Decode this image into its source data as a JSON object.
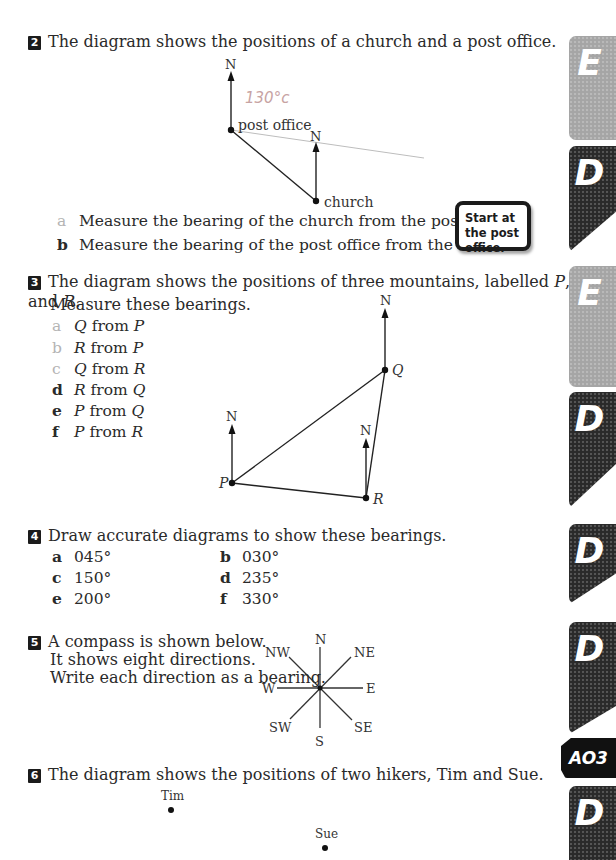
{
  "questions": {
    "q2": {
      "number": "2",
      "text": "The diagram shows the positions of a church and a post office.",
      "diagram": {
        "north_label": "N",
        "post_office_label": "post office",
        "church_label": "church",
        "handwritten_note": "130°c"
      },
      "parts": [
        {
          "label": "a",
          "text": "Measure the bearing of the church from the post office."
        },
        {
          "label": "b",
          "text": "Measure the bearing of the post office from the church."
        }
      ],
      "hint": "Start at the post office."
    },
    "q3": {
      "number": "3",
      "text": "The diagram shows the positions of three mountains, labelled P, Q and R.",
      "text_parts": [
        "The diagram shows the positions of three mountains, labelled ",
        "P",
        ", ",
        "Q",
        " and ",
        "R",
        "."
      ],
      "instruction": "Measure these bearings.",
      "diagram": {
        "north_label": "N",
        "points": [
          "P",
          "Q",
          "R"
        ]
      },
      "parts": [
        {
          "label": "a",
          "a": "Q",
          "from": "from",
          "b": "P"
        },
        {
          "label": "b",
          "a": "R",
          "from": "from",
          "b": "P"
        },
        {
          "label": "c",
          "a": "Q",
          "from": "from",
          "b": "R"
        },
        {
          "label": "d",
          "a": "R",
          "from": "from",
          "b": "Q"
        },
        {
          "label": "e",
          "a": "P",
          "from": "from",
          "b": "Q"
        },
        {
          "label": "f",
          "a": "P",
          "from": "from",
          "b": "R"
        }
      ]
    },
    "q4": {
      "number": "4",
      "text": "Draw accurate diagrams to show these bearings.",
      "parts": [
        {
          "label": "a",
          "value": "045°"
        },
        {
          "label": "b",
          "value": "030°"
        },
        {
          "label": "c",
          "value": "150°"
        },
        {
          "label": "d",
          "value": "235°"
        },
        {
          "label": "e",
          "value": "200°"
        },
        {
          "label": "f",
          "value": "330°"
        }
      ]
    },
    "q5": {
      "number": "5",
      "lines": [
        "A compass is shown below.",
        "It shows eight directions.",
        "Write each direction as a bearing."
      ],
      "compass": {
        "N": "N",
        "NE": "NE",
        "E": "E",
        "SE": "SE",
        "S": "S",
        "SW": "SW",
        "W": "W",
        "NW": "NW"
      }
    },
    "q6": {
      "number": "6",
      "text": "The diagram shows the positions of two hikers, Tim and Sue.",
      "hikers": [
        "Tim",
        "Sue"
      ]
    }
  },
  "grade_tabs": [
    "E",
    "D",
    "E",
    "D",
    "D",
    "D",
    "D"
  ],
  "assessment_tab": "AO3"
}
